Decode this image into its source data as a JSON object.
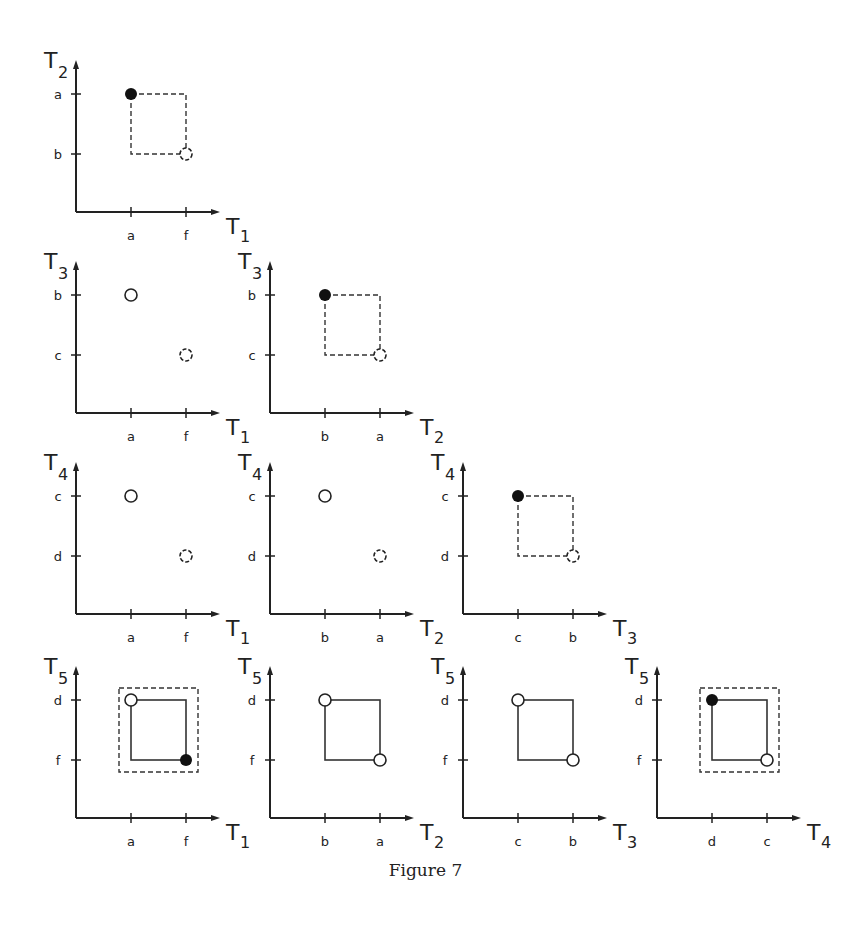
{
  "caption": "Figure 7",
  "layout": {
    "col_origins_x": [
      76,
      270,
      463,
      657
    ],
    "row_origins_y": [
      212,
      413,
      614,
      818
    ],
    "tick_offset_1": 55,
    "tick_offset_2": 110,
    "y_tick_hi": 118,
    "y_tick_lo": 58,
    "axis_len_x": 140,
    "axis_len_y": 148
  },
  "panels": [
    {
      "row": 0,
      "col": 0,
      "x_axis": {
        "name": "T",
        "sub": "1",
        "ticks": [
          "a",
          "f"
        ]
      },
      "y_axis": {
        "name": "T",
        "sub": "2",
        "ticks": [
          "a",
          "b"
        ]
      },
      "points": [
        {
          "xi": 0,
          "yi": 0,
          "type": "filled"
        },
        {
          "xi": 1,
          "yi": 1,
          "type": "open-dashed"
        }
      ],
      "rect": "dashed",
      "outer_box": false
    },
    {
      "row": 1,
      "col": 0,
      "x_axis": {
        "name": "T",
        "sub": "1",
        "ticks": [
          "a",
          "f"
        ]
      },
      "y_axis": {
        "name": "T",
        "sub": "3",
        "ticks": [
          "b",
          "c"
        ]
      },
      "points": [
        {
          "xi": 0,
          "yi": 0,
          "type": "open"
        },
        {
          "xi": 1,
          "yi": 1,
          "type": "open-dashed"
        }
      ],
      "rect": "none",
      "outer_box": false
    },
    {
      "row": 1,
      "col": 1,
      "x_axis": {
        "name": "T",
        "sub": "2",
        "ticks": [
          "b",
          "a"
        ]
      },
      "y_axis": {
        "name": "T",
        "sub": "3",
        "ticks": [
          "b",
          "c"
        ]
      },
      "points": [
        {
          "xi": 0,
          "yi": 0,
          "type": "filled"
        },
        {
          "xi": 1,
          "yi": 1,
          "type": "open-dashed"
        }
      ],
      "rect": "dashed",
      "outer_box": false
    },
    {
      "row": 2,
      "col": 0,
      "x_axis": {
        "name": "T",
        "sub": "1",
        "ticks": [
          "a",
          "f"
        ]
      },
      "y_axis": {
        "name": "T",
        "sub": "4",
        "ticks": [
          "c",
          "d"
        ]
      },
      "points": [
        {
          "xi": 0,
          "yi": 0,
          "type": "open"
        },
        {
          "xi": 1,
          "yi": 1,
          "type": "open-dashed"
        }
      ],
      "rect": "none",
      "outer_box": false
    },
    {
      "row": 2,
      "col": 1,
      "x_axis": {
        "name": "T",
        "sub": "2",
        "ticks": [
          "b",
          "a"
        ]
      },
      "y_axis": {
        "name": "T",
        "sub": "4",
        "ticks": [
          "c",
          "d"
        ]
      },
      "points": [
        {
          "xi": 0,
          "yi": 0,
          "type": "open"
        },
        {
          "xi": 1,
          "yi": 1,
          "type": "open-dashed"
        }
      ],
      "rect": "none",
      "outer_box": false
    },
    {
      "row": 2,
      "col": 2,
      "x_axis": {
        "name": "T",
        "sub": "3",
        "ticks": [
          "c",
          "b"
        ]
      },
      "y_axis": {
        "name": "T",
        "sub": "4",
        "ticks": [
          "c",
          "d"
        ]
      },
      "points": [
        {
          "xi": 0,
          "yi": 0,
          "type": "filled"
        },
        {
          "xi": 1,
          "yi": 1,
          "type": "open-dashed"
        }
      ],
      "rect": "dashed",
      "outer_box": false
    },
    {
      "row": 3,
      "col": 0,
      "x_axis": {
        "name": "T",
        "sub": "1",
        "ticks": [
          "a",
          "f"
        ]
      },
      "y_axis": {
        "name": "T",
        "sub": "5",
        "ticks": [
          "d",
          "f"
        ]
      },
      "points": [
        {
          "xi": 0,
          "yi": 0,
          "type": "open"
        },
        {
          "xi": 1,
          "yi": 1,
          "type": "filled"
        }
      ],
      "rect": "solid",
      "outer_box": true
    },
    {
      "row": 3,
      "col": 1,
      "x_axis": {
        "name": "T",
        "sub": "2",
        "ticks": [
          "b",
          "a"
        ]
      },
      "y_axis": {
        "name": "T",
        "sub": "5",
        "ticks": [
          "d",
          "f"
        ]
      },
      "points": [
        {
          "xi": 0,
          "yi": 0,
          "type": "open"
        },
        {
          "xi": 1,
          "yi": 1,
          "type": "open"
        }
      ],
      "rect": "solid",
      "outer_box": false
    },
    {
      "row": 3,
      "col": 2,
      "x_axis": {
        "name": "T",
        "sub": "3",
        "ticks": [
          "c",
          "b"
        ]
      },
      "y_axis": {
        "name": "T",
        "sub": "5",
        "ticks": [
          "d",
          "f"
        ]
      },
      "points": [
        {
          "xi": 0,
          "yi": 0,
          "type": "open"
        },
        {
          "xi": 1,
          "yi": 1,
          "type": "open"
        }
      ],
      "rect": "solid",
      "outer_box": false
    },
    {
      "row": 3,
      "col": 3,
      "x_axis": {
        "name": "T",
        "sub": "4",
        "ticks": [
          "d",
          "c"
        ]
      },
      "y_axis": {
        "name": "T",
        "sub": "5",
        "ticks": [
          "d",
          "f"
        ]
      },
      "points": [
        {
          "xi": 0,
          "yi": 0,
          "type": "filled"
        },
        {
          "xi": 1,
          "yi": 1,
          "type": "open"
        }
      ],
      "rect": "solid",
      "outer_box": true
    }
  ]
}
